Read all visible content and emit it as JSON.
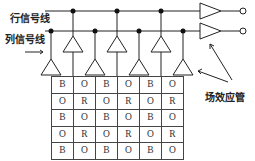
{
  "labels": {
    "row_signal_line": "行信号线",
    "column_signal_line": "列信号线",
    "fet": "场效应管"
  },
  "grid": {
    "rows": [
      [
        "B",
        "O",
        "B",
        "O",
        "B",
        "O"
      ],
      [
        "O",
        "R",
        "O",
        "R",
        "O",
        "R"
      ],
      [
        "B",
        "O",
        "B",
        "O",
        "B",
        "O"
      ],
      [
        "O",
        "R",
        "O",
        "R",
        "O",
        "R"
      ],
      [
        "B",
        "O",
        "B",
        "O",
        "B",
        "O"
      ]
    ]
  },
  "colors": {
    "line": "#222222",
    "cell_border": "#444444",
    "text": "#333333"
  }
}
